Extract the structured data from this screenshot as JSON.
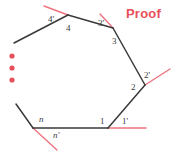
{
  "figure": {
    "title": "Proof",
    "title_color": "#e8505b",
    "line_color": "#3a3a3a",
    "ray_color": "#f0737f",
    "dot_color": "#e8505b",
    "background": "#ffffff",
    "width": 177,
    "height": 153,
    "ellipsis_dots": [
      {
        "cx": 12,
        "cy": 56,
        "r": 2.6
      },
      {
        "cx": 12,
        "cy": 68,
        "r": 2.6
      },
      {
        "cx": 12,
        "cy": 80,
        "r": 2.6
      }
    ],
    "vertices": [
      {
        "id": "v4",
        "label": "4",
        "x": 68,
        "y": 15
      },
      {
        "id": "v3",
        "label": "3",
        "x": 113,
        "y": 28
      },
      {
        "id": "v2",
        "label": "2",
        "x": 145,
        "y": 85
      },
      {
        "id": "v1",
        "label": "1",
        "x": 108,
        "y": 128
      },
      {
        "id": "vn",
        "label": "n",
        "x": 33,
        "y": 128
      },
      {
        "id": "open_left",
        "label": "",
        "x": 14,
        "y": 43
      }
    ],
    "polygon_path": "M 14 43 L 68 15 L 113 28 L 145 85 L 108 128 L 33 128 L 14 100",
    "edges": [
      {
        "name": "edge-open-to-4",
        "x1": 14,
        "y1": 43,
        "x2": 68,
        "y2": 15
      },
      {
        "name": "edge-4-to-3",
        "x1": 68,
        "y1": 15,
        "x2": 113,
        "y2": 28
      },
      {
        "name": "edge-3-to-2",
        "x1": 113,
        "y1": 28,
        "x2": 145,
        "y2": 85
      },
      {
        "name": "edge-2-to-1",
        "x1": 145,
        "y1": 85,
        "x2": 108,
        "y2": 128
      },
      {
        "name": "edge-1-to-n",
        "x1": 108,
        "y1": 128,
        "x2": 33,
        "y2": 128
      },
      {
        "name": "edge-n-open",
        "x1": 33,
        "y1": 128,
        "x2": 16,
        "y2": 104
      }
    ],
    "exterior_rays": [
      {
        "name": "ray-4-prime",
        "x1": 68,
        "y1": 15,
        "x2": 44,
        "y2": 6
      },
      {
        "name": "ray-3-prime",
        "x1": 113,
        "y1": 28,
        "x2": 100,
        "y2": 14
      },
      {
        "name": "ray-2-prime",
        "x1": 145,
        "y1": 85,
        "x2": 170,
        "y2": 69
      },
      {
        "name": "ray-1-prime",
        "x1": 108,
        "y1": 128,
        "x2": 146,
        "y2": 128
      },
      {
        "name": "ray-n-prime",
        "x1": 33,
        "y1": 128,
        "x2": 57,
        "y2": 150
      }
    ],
    "interior_labels": [
      {
        "name": "interior-angle-4",
        "text": "4",
        "x": 66,
        "y": 24,
        "italic": false
      },
      {
        "name": "interior-angle-3",
        "text": "3",
        "x": 112,
        "y": 37,
        "italic": false
      },
      {
        "name": "interior-angle-2",
        "text": "2",
        "x": 131,
        "y": 83,
        "italic": false
      },
      {
        "name": "interior-angle-1",
        "text": "1",
        "x": 100,
        "y": 117,
        "italic": false
      },
      {
        "name": "interior-angle-n",
        "text": "n",
        "x": 39,
        "y": 115,
        "italic": true
      }
    ],
    "exterior_labels": [
      {
        "name": "exterior-angle-4-prime",
        "text": "4'",
        "x": 48,
        "y": 15,
        "italic": false
      },
      {
        "name": "exterior-angle-3-prime",
        "text": "3'",
        "x": 98,
        "y": 19,
        "italic": false
      },
      {
        "name": "exterior-angle-2-prime",
        "text": "2'",
        "x": 144,
        "y": 71,
        "italic": false
      },
      {
        "name": "exterior-angle-1-prime",
        "text": "1'",
        "x": 122,
        "y": 117,
        "italic": false
      },
      {
        "name": "exterior-angle-n-prime",
        "text": "n'",
        "x": 53,
        "y": 131,
        "italic": true
      }
    ],
    "title_position": {
      "x": 126,
      "y": 6
    }
  }
}
